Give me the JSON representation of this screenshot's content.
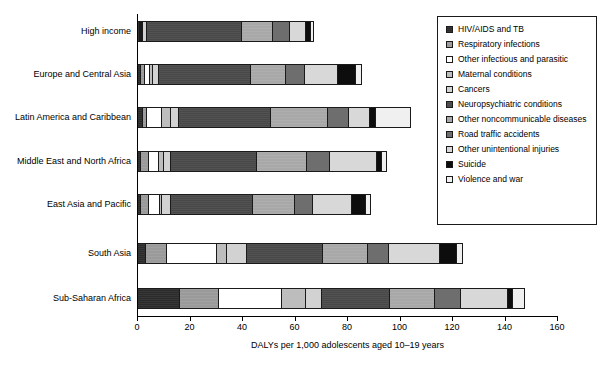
{
  "chart_data": {
    "type": "bar",
    "orientation": "horizontal",
    "stacked": true,
    "title": "",
    "xlabel": "DALYs per 1,000 adolescents aged 10–19 years",
    "ylabel": "",
    "xlim": [
      0,
      160
    ],
    "xticks": [
      0,
      20,
      40,
      60,
      80,
      100,
      120,
      140,
      160
    ],
    "grid": false,
    "legend_position": "top-right",
    "categories": [
      "High income",
      "Europe and Central Asia",
      "Latin America and Caribbean",
      "Middle East and North Africa",
      "East Asia and Pacific",
      "South Asia",
      "Sub-Saharan Africa"
    ],
    "series": [
      {
        "name": "HIV/AIDS and TB",
        "values": [
          0.6,
          1.0,
          2.0,
          1.0,
          1.2,
          3.0,
          16.0
        ]
      },
      {
        "name": "Respiratory infections",
        "values": [
          0.5,
          1.6,
          1.5,
          3.0,
          3.0,
          8.0,
          15.0
        ]
      },
      {
        "name": "Other infectious and parasitic",
        "values": [
          0.6,
          2.0,
          5.5,
          4.0,
          4.0,
          19.0,
          24.0
        ]
      },
      {
        "name": "Maternal conditions",
        "values": [
          0.3,
          1.2,
          3.5,
          2.0,
          1.0,
          4.0,
          9.0
        ]
      },
      {
        "name": "Cancers",
        "values": [
          1.5,
          2.2,
          3.0,
          2.5,
          3.5,
          7.5,
          6.0
        ]
      },
      {
        "name": "Neuropsychiatric conditions",
        "values": [
          36.0,
          35.0,
          35.0,
          33.0,
          31.0,
          29.0,
          26.0
        ]
      },
      {
        "name": "Other noncommunicable diseases",
        "values": [
          12.0,
          13.5,
          22.0,
          19.0,
          16.0,
          17.0,
          17.0
        ]
      },
      {
        "name": "Road traffic accidents",
        "values": [
          6.5,
          7.0,
          8.0,
          8.5,
          7.0,
          8.0,
          10.0
        ]
      },
      {
        "name": "Other unintentional injuries",
        "values": [
          6.0,
          12.5,
          8.0,
          18.0,
          15.0,
          19.5,
          18.0
        ]
      },
      {
        "name": "Suicide",
        "values": [
          2.0,
          7.0,
          2.0,
          2.0,
          5.0,
          6.5,
          2.0
        ]
      },
      {
        "name": "Violence and war",
        "values": [
          0.5,
          2.0,
          13.0,
          1.5,
          1.5,
          2.0,
          4.0
        ]
      }
    ],
    "totals": [
      66.5,
      85.0,
      103.5,
      94.5,
      88.2,
      123.5,
      147.0
    ]
  },
  "legend": {
    "items": [
      {
        "label": "HIV/AIDS and TB",
        "color": "#2b2b2b"
      },
      {
        "label": "Respiratory infections",
        "color": "#9a9a9a"
      },
      {
        "label": "Other infectious and parasitic",
        "color": "#ffffff"
      },
      {
        "label": "Maternal conditions",
        "color": "#bdbdbd"
      },
      {
        "label": "Cancers",
        "color": "#d2d2d2"
      },
      {
        "label": "Neuropsychiatric conditions",
        "color": "#484848"
      },
      {
        "label": "Other noncommunicable diseases",
        "color": "#a8a8a8"
      },
      {
        "label": "Road traffic accidents",
        "color": "#6e6e6e"
      },
      {
        "label": "Other unintentional injuries",
        "color": "#d8d8d8"
      },
      {
        "label": "Suicide",
        "color": "#0d0d0d"
      },
      {
        "label": "Violence and war",
        "color": "#f0f0f0"
      }
    ]
  },
  "axis": {
    "x_tick_labels": [
      "0",
      "20",
      "40",
      "60",
      "80",
      "100",
      "120",
      "140",
      "160"
    ],
    "x_title": "DALYs per 1,000 adolescents aged 10–19 years"
  }
}
